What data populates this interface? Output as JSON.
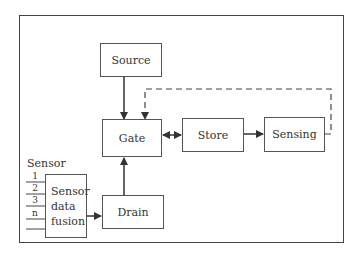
{
  "diagram": {
    "nodes": {
      "source": "Source",
      "gate": "Gate",
      "store": "Store",
      "sensing": "Sensing",
      "drain": "Drain"
    },
    "sensor": {
      "title": "Sensor",
      "inputs": [
        "1",
        "2",
        "3",
        "n"
      ],
      "fusion_lines": [
        "Sensor",
        "data",
        "fusion"
      ]
    },
    "edges": [
      {
        "from": "source",
        "to": "gate",
        "style": "solid"
      },
      {
        "from": "gate",
        "to": "store",
        "style": "solid-bidirectional"
      },
      {
        "from": "store",
        "to": "sensing",
        "style": "solid"
      },
      {
        "from": "sensing",
        "to": "gate",
        "style": "dashed"
      },
      {
        "from": "drain",
        "to": "gate",
        "style": "solid"
      },
      {
        "from": "sensor_data_fusion",
        "to": "drain",
        "style": "solid"
      }
    ]
  }
}
